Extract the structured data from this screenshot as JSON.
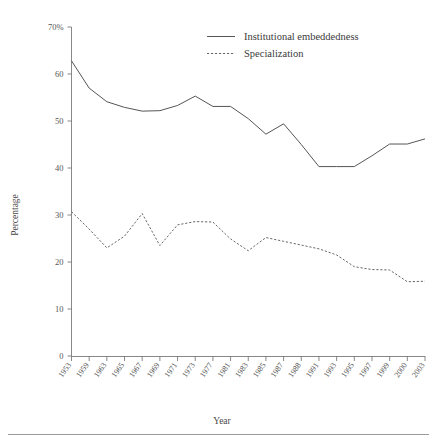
{
  "chart_data": {
    "type": "line",
    "title": "",
    "subtitle": "",
    "xlabel": "Year",
    "ylabel": "Percentage",
    "grid": false,
    "legend_position": "top-right",
    "ylim": [
      0,
      70
    ],
    "yticks": [
      0,
      10,
      20,
      30,
      40,
      50,
      60,
      70
    ],
    "ytick_labels": [
      "0",
      "10",
      "20",
      "30",
      "40",
      "50",
      "60",
      "70%"
    ],
    "categories": [
      "1953",
      "1959",
      "1963",
      "1965",
      "1967",
      "1969",
      "1971",
      "1973",
      "1977",
      "1981",
      "1983",
      "1985",
      "1987",
      "1988",
      "1991",
      "1993",
      "1995",
      "1997",
      "1999",
      "2000",
      "2003"
    ],
    "series": [
      {
        "name": "Institutional embeddedness",
        "style": "solid",
        "values": [
          62.8,
          57.0,
          54.1,
          52.9,
          52.1,
          52.2,
          53.3,
          55.3,
          53.1,
          53.1,
          50.5,
          47.2,
          49.4,
          45.0,
          40.3,
          40.3,
          40.3,
          42.6,
          45.1,
          45.1,
          46.2
        ]
      },
      {
        "name": "Specialization",
        "style": "dashed",
        "values": [
          30.7,
          27.0,
          23.0,
          25.5,
          30.3,
          23.5,
          27.9,
          28.6,
          28.5,
          24.9,
          22.4,
          25.2,
          24.4,
          23.6,
          22.8,
          21.5,
          19.0,
          18.4,
          18.3,
          15.8,
          15.9
        ]
      }
    ]
  },
  "legend": {
    "entries": [
      {
        "label": "Institutional embeddedness",
        "style": "solid"
      },
      {
        "label": "Specialization",
        "style": "dashed"
      }
    ]
  },
  "axes": {
    "y_axis_title": "Percentage",
    "x_axis_title": "Year"
  }
}
